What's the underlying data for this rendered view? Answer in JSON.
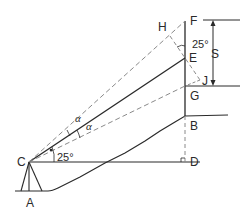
{
  "diagram": {
    "title": "",
    "points": {
      "A": "A",
      "B": "B",
      "C": "C",
      "D": "D",
      "E": "E",
      "F": "F",
      "G": "G",
      "H": "H",
      "J": "J"
    },
    "labels": {
      "angle_horizontal": "25°",
      "angle_at_e": "25°",
      "alpha_upper": "α",
      "alpha_lower": "α",
      "staff_intercept": "S"
    },
    "colors": {
      "line": "#2a2a2a",
      "dashed": "#8a8a8a"
    }
  }
}
